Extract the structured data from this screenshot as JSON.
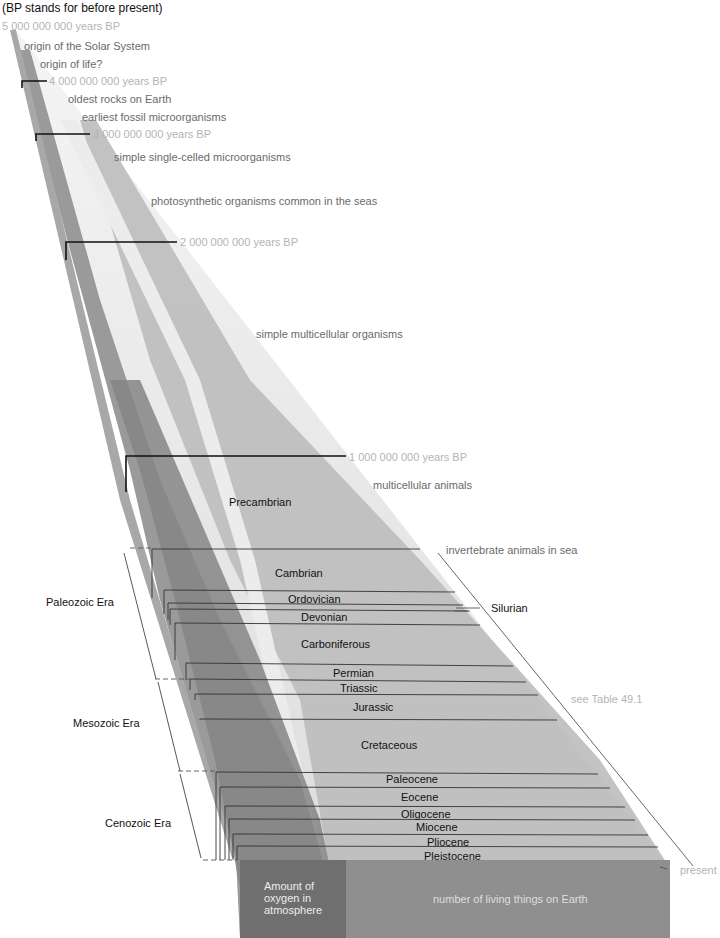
{
  "caption": "(BP stands for before present)",
  "time_markers": [
    {
      "label": "5 000 000 000 years BP",
      "x": 2,
      "y": 20
    },
    {
      "label": "4 000 000 000 years BP",
      "x": 49,
      "y": 80
    },
    {
      "label": "3 000 000 000 years BP",
      "x": 93,
      "y": 130
    },
    {
      "label": "2 000 000 000 years BP",
      "x": 180,
      "y": 237
    },
    {
      "label": "1 000 000 000 years BP",
      "x": 349,
      "y": 453
    }
  ],
  "events": [
    {
      "label": "origin of the Solar System",
      "x": 24,
      "y": 40
    },
    {
      "label": "origin of life?",
      "x": 40,
      "y": 58
    },
    {
      "label": "oldest rocks on Earth",
      "x": 68,
      "y": 93
    },
    {
      "label": "earliest fossil microorganisms",
      "x": 82,
      "y": 111
    },
    {
      "label": "simple single-celled microorganisms",
      "x": 114,
      "y": 151
    },
    {
      "label": "photosynthetic organisms common in the seas",
      "x": 151,
      "y": 195
    },
    {
      "label": "simple multicellular organisms",
      "x": 256,
      "y": 328
    },
    {
      "label": "multicellular animals",
      "x": 373,
      "y": 479
    },
    {
      "label": "invertebrate animals in sea",
      "x": 446,
      "y": 544
    }
  ],
  "precambrian_label": "Precambrian",
  "periods": [
    {
      "label": "Cambrian",
      "x": 275,
      "y": 567
    },
    {
      "label": "Ordovician",
      "x": 288,
      "y": 593
    },
    {
      "label": "Devonian",
      "x": 301,
      "y": 611
    },
    {
      "label": "Carboniferous",
      "x": 301,
      "y": 638
    },
    {
      "label": "Permian",
      "x": 333,
      "y": 667
    },
    {
      "label": "Triassic",
      "x": 340,
      "y": 682
    },
    {
      "label": "Jurassic",
      "x": 353,
      "y": 701
    },
    {
      "label": "Cretaceous",
      "x": 361,
      "y": 739
    },
    {
      "label": "Paleocene",
      "x": 386,
      "y": 773
    },
    {
      "label": "Eocene",
      "x": 401,
      "y": 791
    },
    {
      "label": "Oligocene",
      "x": 401,
      "y": 808
    },
    {
      "label": "Miocene",
      "x": 416,
      "y": 821
    },
    {
      "label": "Pliocene",
      "x": 427,
      "y": 836
    },
    {
      "label": "Pleistocene",
      "x": 424,
      "y": 850
    }
  ],
  "silurian_label": "Silurian",
  "eras": [
    {
      "label": "Paleozoic Era",
      "x": 46,
      "y": 596
    },
    {
      "label": "Mesozoic Era",
      "x": 73,
      "y": 717
    },
    {
      "label": "Cenozoic Era",
      "x": 105,
      "y": 817
    }
  ],
  "see_table": "see Table 49.1",
  "present_label": "present",
  "bottom_face": {
    "oxygen_label": "Amount of oxygen in atmosphere",
    "living_label": "number of living things on Earth"
  },
  "colors": {
    "wedge_light": "#e9e9e9",
    "band_mid": "#b9b9b9",
    "band_dark": "#8e8e8e",
    "front_oxygen": "#6f6f6f",
    "front_living": "#8d8d8d",
    "marker_text": "#b4b4b4"
  }
}
